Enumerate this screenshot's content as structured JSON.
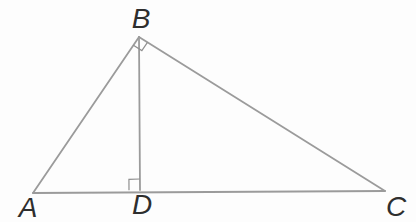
{
  "figure": {
    "canvas": {
      "width": 416,
      "height": 222,
      "background": "#fdfdfd"
    },
    "style": {
      "line_color": "#9b9b9b",
      "line_width": 1.8,
      "mark_color": "#8f8f8f",
      "mark_width": 1.2,
      "label_color": "#2e2e2e",
      "label_font_size": 28
    },
    "points": {
      "A": {
        "x": 33,
        "y": 193
      },
      "B": {
        "x": 139,
        "y": 37
      },
      "C": {
        "x": 385,
        "y": 191
      },
      "D": {
        "x": 140,
        "y": 190
      }
    },
    "segments": [
      {
        "name": "side-ab",
        "from": "A",
        "to": "B"
      },
      {
        "name": "side-bc",
        "from": "B",
        "to": "C"
      },
      {
        "name": "base-ac",
        "from": "A",
        "to": "C"
      },
      {
        "name": "altitude-bd",
        "from": "B",
        "to": "D"
      }
    ],
    "right_angle_marks": [
      {
        "name": "right-angle-mark-b",
        "vertex": "B",
        "ray1": "A",
        "ray2": "C",
        "size": 10
      },
      {
        "name": "right-angle-mark-d",
        "vertex": "D",
        "ray1": "A",
        "ray2": "B",
        "size": 11
      }
    ],
    "labels": [
      {
        "name": "vertex-label-a",
        "text": "A",
        "x": 28,
        "y": 217
      },
      {
        "name": "vertex-label-b",
        "text": "B",
        "x": 141,
        "y": 28
      },
      {
        "name": "vertex-label-c",
        "text": "C",
        "x": 396,
        "y": 216
      },
      {
        "name": "vertex-label-d",
        "text": "D",
        "x": 142,
        "y": 214
      }
    ]
  }
}
